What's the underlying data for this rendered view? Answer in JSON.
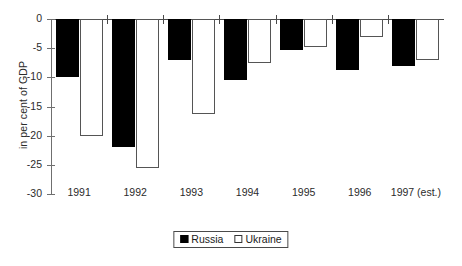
{
  "chart_data": {
    "type": "bar",
    "title": "",
    "xlabel": "",
    "ylabel": "in per cent of GDP",
    "categories": [
      "1991",
      "1992",
      "1993",
      "1994",
      "1995",
      "1996",
      "1997 (est.)"
    ],
    "series": [
      {
        "name": "Russia",
        "color": "#000000",
        "values": [
          -10.0,
          -22.0,
          -7.0,
          -10.5,
          -5.3,
          -8.8,
          -8.0
        ]
      },
      {
        "name": "Ukraine",
        "color": "#FFFFFF",
        "values": [
          -20.0,
          -25.5,
          -16.3,
          -7.5,
          -4.8,
          -3.0,
          -7.0
        ]
      }
    ],
    "ylim": [
      -30,
      0
    ],
    "yticks": [
      "0",
      "-5",
      "-10",
      "-15",
      "-20",
      "-25",
      "-30"
    ],
    "ytick_values": [
      0,
      -5,
      -10,
      -15,
      -20,
      -25,
      -30
    ],
    "grid": false,
    "legend_position": "bottom-center",
    "legend": [
      {
        "label": "Russia",
        "swatch": "filled-square"
      },
      {
        "label": "Ukraine",
        "swatch": "hollow-square"
      }
    ]
  }
}
